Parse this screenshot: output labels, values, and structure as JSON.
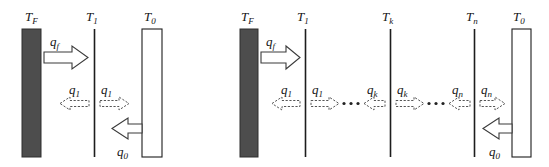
{
  "figure": {
    "background_color": "#ffffff",
    "dark_wall_color": "#4d4d4d",
    "light_wall_color": "#ffffff",
    "outline_color": "#1d1d1d",
    "panels": [
      {
        "id": "left-panel",
        "name": "single-shield-diagram",
        "surfaces": [
          {
            "id": "tf",
            "label_base": "T",
            "label_sub": "F",
            "type": "dark-wall"
          },
          {
            "id": "t1",
            "label_base": "T",
            "label_sub": "1",
            "type": "thin-line"
          },
          {
            "id": "t0",
            "label_base": "T",
            "label_sub": "0",
            "type": "light-wall"
          }
        ],
        "fluxes": [
          {
            "id": "qf",
            "label_base": "q",
            "label_sub": "f",
            "direction": "right",
            "style": "solid"
          },
          {
            "id": "q1-left",
            "label_base": "q",
            "label_sub": "1",
            "direction": "left",
            "style": "dashed"
          },
          {
            "id": "q1-right",
            "label_base": "q",
            "label_sub": "1",
            "direction": "right",
            "style": "dashed"
          },
          {
            "id": "q0",
            "label_base": "q",
            "label_sub": "0",
            "direction": "left",
            "style": "solid"
          }
        ]
      },
      {
        "id": "right-panel",
        "name": "multi-shield-diagram",
        "surfaces": [
          {
            "id": "tf",
            "label_base": "T",
            "label_sub": "F",
            "type": "dark-wall"
          },
          {
            "id": "t1",
            "label_base": "T",
            "label_sub": "1",
            "type": "thin-line"
          },
          {
            "id": "tk",
            "label_base": "T",
            "label_sub": "k",
            "type": "thin-line"
          },
          {
            "id": "tn",
            "label_base": "T",
            "label_sub": "n",
            "type": "thin-line"
          },
          {
            "id": "t0",
            "label_base": "T",
            "label_sub": "0",
            "type": "light-wall"
          }
        ],
        "fluxes": [
          {
            "id": "qf",
            "label_base": "q",
            "label_sub": "f",
            "direction": "right",
            "style": "solid"
          },
          {
            "id": "q1-left",
            "label_base": "q",
            "label_sub": "1",
            "direction": "left",
            "style": "dashed"
          },
          {
            "id": "q1-right",
            "label_base": "q",
            "label_sub": "1",
            "direction": "right",
            "style": "dashed"
          },
          {
            "id": "qk-left",
            "label_base": "q",
            "label_sub": "k",
            "direction": "left",
            "style": "dashed"
          },
          {
            "id": "qk-right",
            "label_base": "q",
            "label_sub": "k",
            "direction": "right",
            "style": "dashed"
          },
          {
            "id": "qn-left",
            "label_base": "q",
            "label_sub": "n",
            "direction": "left",
            "style": "dashed"
          },
          {
            "id": "qn-right",
            "label_base": "q",
            "label_sub": "n",
            "direction": "right",
            "style": "dashed"
          },
          {
            "id": "q0",
            "label_base": "q",
            "label_sub": "0",
            "direction": "left",
            "style": "solid"
          }
        ],
        "ellipses": [
          {
            "id": "ellipsis-1",
            "text": "•••"
          },
          {
            "id": "ellipsis-2",
            "text": "•••"
          }
        ]
      }
    ]
  }
}
